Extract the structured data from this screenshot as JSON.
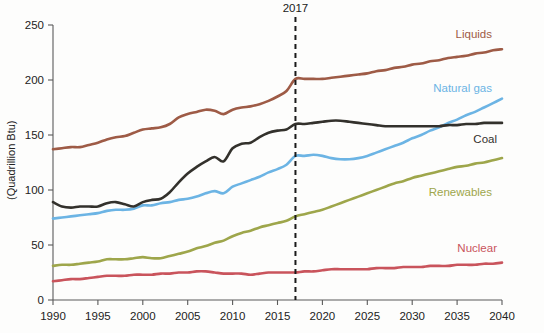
{
  "chart_data": {
    "type": "line",
    "title": "",
    "subtitle": "",
    "xlabel": "",
    "ylabel": "(Quadrillion Btu)",
    "xlim": [
      1990,
      2040
    ],
    "ylim": [
      0,
      250
    ],
    "xticks": [
      1990,
      1995,
      2000,
      2005,
      2010,
      2015,
      2020,
      2025,
      2030,
      2035,
      2040
    ],
    "yticks": [
      0,
      50,
      100,
      150,
      200,
      250
    ],
    "grid": false,
    "legend_position": "inline-right-of-line-end",
    "annotations": [
      {
        "name": "history-projection-divider",
        "label": "2017",
        "x": 2017,
        "style": "vertical-dashed-line",
        "color": "#1a1a1a"
      }
    ],
    "x": [
      1990,
      1991,
      1992,
      1993,
      1994,
      1995,
      1996,
      1997,
      1998,
      1999,
      2000,
      2001,
      2002,
      2003,
      2004,
      2005,
      2006,
      2007,
      2008,
      2009,
      2010,
      2011,
      2012,
      2013,
      2014,
      2015,
      2016,
      2017,
      2018,
      2019,
      2020,
      2021,
      2022,
      2023,
      2024,
      2025,
      2026,
      2027,
      2028,
      2029,
      2030,
      2031,
      2032,
      2033,
      2034,
      2035,
      2036,
      2037,
      2038,
      2039,
      2040
    ],
    "series": [
      {
        "name": "Liquids",
        "label": "Liquids",
        "color": "#9E5B46",
        "values": [
          137,
          138,
          139,
          139,
          141,
          143,
          146,
          148,
          149,
          152,
          155,
          156,
          157,
          160,
          166,
          169,
          171,
          173,
          172,
          169,
          173,
          175,
          176,
          178,
          181,
          185,
          190,
          201,
          201,
          201,
          201,
          202,
          203,
          204,
          205,
          206,
          208,
          209,
          211,
          212,
          214,
          215,
          217,
          218,
          220,
          221,
          222,
          224,
          225,
          227,
          228
        ]
      },
      {
        "name": "Natural gas",
        "label": "Natural gas",
        "color": "#6CB4E4",
        "values": [
          74,
          75,
          76,
          77,
          78,
          79,
          81,
          82,
          82,
          83,
          86,
          86,
          88,
          89,
          91,
          92,
          94,
          97,
          99,
          97,
          103,
          106,
          109,
          112,
          116,
          119,
          123,
          131,
          131,
          132,
          131,
          129,
          128,
          128,
          129,
          131,
          134,
          137,
          140,
          143,
          147,
          150,
          154,
          157,
          161,
          164,
          168,
          171,
          175,
          179,
          183
        ]
      },
      {
        "name": "Coal",
        "label": "Coal",
        "color": "#33312C",
        "values": [
          89,
          85,
          84,
          85,
          85,
          85,
          88,
          89,
          87,
          85,
          89,
          91,
          92,
          98,
          107,
          115,
          121,
          126,
          130,
          126,
          138,
          142,
          143,
          148,
          152,
          154,
          155,
          160,
          160,
          161,
          162,
          163,
          163,
          162,
          161,
          160,
          159,
          158,
          158,
          158,
          158,
          158,
          158,
          158,
          159,
          159,
          160,
          160,
          161,
          161,
          161
        ]
      },
      {
        "name": "Renewables",
        "label": "Renewables",
        "color": "#9EA64B",
        "values": [
          31,
          32,
          32,
          33,
          34,
          35,
          37,
          37,
          37,
          38,
          39,
          38,
          38,
          40,
          42,
          44,
          47,
          49,
          52,
          54,
          58,
          61,
          63,
          66,
          68,
          70,
          72,
          76,
          78,
          80,
          82,
          85,
          88,
          91,
          94,
          97,
          100,
          103,
          106,
          108,
          111,
          113,
          115,
          117,
          119,
          121,
          122,
          124,
          125,
          127,
          129
        ]
      },
      {
        "name": "Nuclear",
        "label": "Nuclear",
        "color": "#C9545C",
        "values": [
          17,
          18,
          19,
          19,
          20,
          21,
          22,
          22,
          22,
          23,
          23,
          23,
          24,
          24,
          25,
          25,
          26,
          26,
          25,
          24,
          24,
          24,
          23,
          24,
          25,
          25,
          25,
          25,
          26,
          26,
          27,
          28,
          28,
          28,
          28,
          28,
          29,
          29,
          29,
          30,
          30,
          30,
          31,
          31,
          31,
          32,
          32,
          32,
          33,
          33,
          34
        ]
      }
    ]
  },
  "axes": {
    "y_title": "(Quadrillion Btu)",
    "y_tick_labels": [
      "0",
      "50",
      "100",
      "150",
      "200",
      "250"
    ],
    "x_tick_labels": [
      "1990",
      "1995",
      "2000",
      "2005",
      "2010",
      "2015",
      "2020",
      "2025",
      "2030",
      "2035",
      "2040"
    ]
  },
  "series_labels": {
    "liquids": "Liquids",
    "natural_gas": "Natural gas",
    "coal": "Coal",
    "renewables": "Renewables",
    "nuclear": "Nuclear"
  },
  "annotation": {
    "divider_year": "2017"
  }
}
